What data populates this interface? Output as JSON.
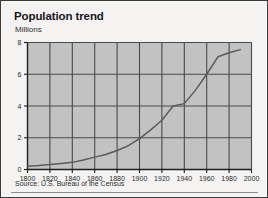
{
  "chart_data": {
    "type": "line",
    "title": "Population trend",
    "ylabel": "Millions",
    "xlabel": "",
    "source": "Source: U.S. Bureau of the Census",
    "grid": true,
    "legend": false,
    "xlim": [
      1800,
      2000
    ],
    "ylim": [
      0,
      8
    ],
    "xticks": [
      1800,
      1820,
      1840,
      1860,
      1880,
      1900,
      1920,
      1940,
      1960,
      1980,
      2000
    ],
    "xtick_labels": [
      "1800",
      "1820",
      "1840",
      "1860",
      "1880",
      "1900",
      "1920",
      "1940",
      "1960",
      "1980",
      "2000"
    ],
    "yticks": [
      0,
      2,
      4,
      6,
      8
    ],
    "ytick_labels": [
      "0",
      "2",
      "4",
      "6",
      "8"
    ],
    "x": [
      1800,
      1810,
      1820,
      1830,
      1840,
      1850,
      1860,
      1870,
      1880,
      1890,
      1900,
      1910,
      1920,
      1930,
      1940,
      1950,
      1960,
      1970,
      1980,
      1990
    ],
    "values": [
      0.2,
      0.25,
      0.32,
      0.38,
      0.45,
      0.6,
      0.78,
      0.95,
      1.2,
      1.5,
      1.95,
      2.5,
      3.1,
      4.0,
      4.15,
      5.0,
      6.0,
      7.1,
      7.35,
      7.55
    ],
    "series": [
      {
        "name": "Population",
        "color": "#5b5b5b",
        "values": [
          0.2,
          0.25,
          0.32,
          0.38,
          0.45,
          0.6,
          0.78,
          0.95,
          1.2,
          1.5,
          1.95,
          2.5,
          3.1,
          4.0,
          4.15,
          5.0,
          6.0,
          7.1,
          7.35,
          7.55
        ]
      }
    ],
    "colors": {
      "plot_background": "#c2c2c2",
      "gridline": "#4a4a4a",
      "axis": "#1f1f1f",
      "line": "#5e5e5e",
      "card_background": "#f4f3f1",
      "border": "#3a3a3a",
      "text": "#2b2b2e"
    }
  }
}
